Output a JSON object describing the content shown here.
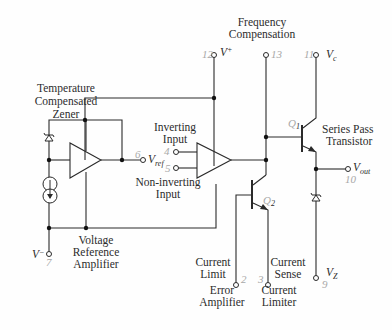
{
  "labels": {
    "temp_zener": [
      "Temperature",
      "Compensated",
      "Zener"
    ],
    "voltage_ref_amp": [
      "Voltage",
      "Reference",
      "Amplifier"
    ],
    "inverting_input": [
      "Inverting",
      "Input"
    ],
    "non_inverting_input": [
      "Non-inverting",
      "Input"
    ],
    "freq_comp": [
      "Frequency",
      "Compensation"
    ],
    "series_pass": [
      "Series Pass",
      "Transistor"
    ],
    "current_limit": [
      "Current",
      "Limit"
    ],
    "current_sense": [
      "Current",
      "Sense"
    ],
    "error_amp": [
      "Error",
      "Amplifier"
    ],
    "current_limiter": [
      "Current",
      "Limiter"
    ]
  },
  "pins": {
    "vplus": {
      "number": "12",
      "symbol": "V",
      "sup": "+"
    },
    "freq": {
      "number": "13"
    },
    "vc": {
      "number": "11",
      "symbol": "V",
      "sub": "c"
    },
    "vref": {
      "number": "6",
      "symbol": "V",
      "sub": "ref"
    },
    "inv": {
      "number": "4"
    },
    "noninv": {
      "number": "5"
    },
    "vout": {
      "number": "10",
      "symbol": "V",
      "sub": "out"
    },
    "vminus": {
      "number": "7",
      "symbol": "V",
      "sup": "−"
    },
    "climit": {
      "number": "2"
    },
    "csense": {
      "number": "3"
    },
    "vz": {
      "number": "9",
      "symbol": "V",
      "sub": "Z"
    }
  },
  "transistors": {
    "q1": "Q",
    "q1_sub": "1",
    "q2": "Q",
    "q2_sub": "2"
  }
}
